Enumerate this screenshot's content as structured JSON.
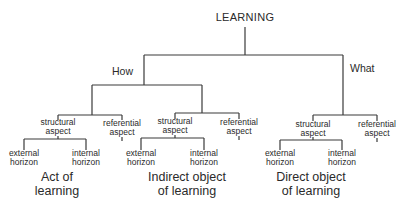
{
  "diagram": {
    "root": "LEARNING",
    "branches": {
      "how": "How",
      "what": "What"
    },
    "aspects": {
      "structural_l1": "structural",
      "structural_l2": "aspect",
      "referential_l1": "referential",
      "referential_l2": "aspect"
    },
    "horizons": {
      "external_l1": "external",
      "internal_l1": "internal",
      "horizon_l2": "horizon"
    },
    "groups": [
      {
        "title_l1": "Act of",
        "title_l2": "learning"
      },
      {
        "title_l1": "Indirect object",
        "title_l2": "of learning"
      },
      {
        "title_l1": "Direct object",
        "title_l2": "of learning"
      }
    ]
  }
}
